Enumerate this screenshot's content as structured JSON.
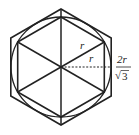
{
  "diagram": {
    "colors": {
      "stroke": "#222222",
      "background": "#ffffff"
    },
    "labels": {
      "radius_diagonal": "r",
      "radius_horizontal": "r",
      "outer_numerator": "2r",
      "outer_denominator_root": "√",
      "outer_denominator_value": "3"
    }
  }
}
